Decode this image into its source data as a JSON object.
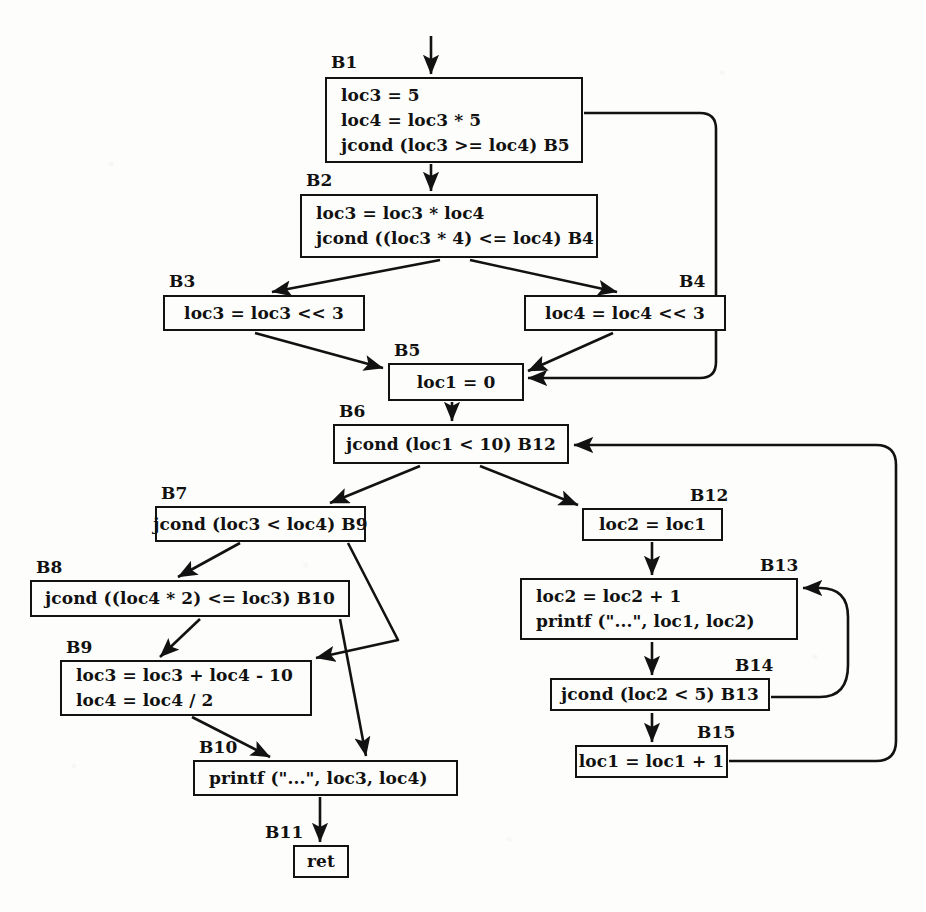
{
  "diagram": {
    "kind": "control-flow-graph",
    "ink_color": "#121212",
    "paper_color": "#fdfdfb"
  },
  "blocks": [
    {
      "id": "B1",
      "label": "B1",
      "label_x": 331,
      "label_y": 52,
      "x": 325,
      "y": 77,
      "w": 258,
      "h": 86,
      "align": "left",
      "statements": [
        "loc3 = 5",
        "loc4 = loc3 * 5",
        "jcond (loc3 >= loc4) B5"
      ]
    },
    {
      "id": "B2",
      "label": "B2",
      "label_x": 306,
      "label_y": 170,
      "x": 300,
      "y": 194,
      "w": 298,
      "h": 64,
      "align": "left",
      "statements": [
        "loc3 = loc3 * loc4",
        "jcond ((loc3 * 4) <= loc4) B4"
      ]
    },
    {
      "id": "B3",
      "label": "B3",
      "label_x": 169,
      "label_y": 271,
      "x": 163,
      "y": 295,
      "w": 202,
      "h": 36,
      "align": "center",
      "statements": [
        "loc3 = loc3 << 3"
      ]
    },
    {
      "id": "B4",
      "label": "B4",
      "label_x": 679,
      "label_y": 271,
      "x": 524,
      "y": 295,
      "w": 202,
      "h": 36,
      "align": "center",
      "statements": [
        "loc4 = loc4 << 3"
      ]
    },
    {
      "id": "B5",
      "label": "B5",
      "label_x": 394,
      "label_y": 340,
      "x": 388,
      "y": 363,
      "w": 136,
      "h": 38,
      "align": "center",
      "statements": [
        "loc1 = 0"
      ]
    },
    {
      "id": "B6",
      "label": "B6",
      "label_x": 339,
      "label_y": 401,
      "x": 333,
      "y": 424,
      "w": 236,
      "h": 40,
      "align": "center",
      "statements": [
        "jcond (loc1 < 10) B12"
      ]
    },
    {
      "id": "B7",
      "label": "B7",
      "label_x": 161,
      "label_y": 483,
      "x": 155,
      "y": 506,
      "w": 211,
      "h": 36,
      "align": "center",
      "statements": [
        "jcond (loc3 < loc4) B9"
      ]
    },
    {
      "id": "B8",
      "label": "B8",
      "label_x": 36,
      "label_y": 557,
      "x": 30,
      "y": 580,
      "w": 320,
      "h": 37,
      "align": "center",
      "statements": [
        "jcond ((loc4 * 2) <= loc3) B10"
      ]
    },
    {
      "id": "B9",
      "label": "B9",
      "label_x": 66,
      "label_y": 637,
      "x": 60,
      "y": 660,
      "w": 252,
      "h": 56,
      "align": "left",
      "statements": [
        "loc3 = loc3 + loc4 - 10",
        "loc4 = loc4 / 2"
      ]
    },
    {
      "id": "B10",
      "label": "B10",
      "label_x": 199,
      "label_y": 737,
      "x": 193,
      "y": 760,
      "w": 265,
      "h": 36,
      "align": "left",
      "statements": [
        "printf (\"...\", loc3, loc4)"
      ]
    },
    {
      "id": "B11",
      "label": "B11",
      "label_x": 265,
      "label_y": 822,
      "x": 293,
      "y": 845,
      "w": 56,
      "h": 33,
      "align": "center",
      "statements": [
        "ret"
      ]
    },
    {
      "id": "B12",
      "label": "B12",
      "label_x": 690,
      "label_y": 485,
      "x": 582,
      "y": 508,
      "w": 141,
      "h": 33,
      "align": "center",
      "statements": [
        "loc2 = loc1"
      ]
    },
    {
      "id": "B13",
      "label": "B13",
      "label_x": 760,
      "label_y": 555,
      "x": 520,
      "y": 578,
      "w": 278,
      "h": 62,
      "align": "left",
      "statements": [
        "loc2 = loc2 + 1",
        "printf (\"...\", loc1, loc2)"
      ]
    },
    {
      "id": "B14",
      "label": "B14",
      "label_x": 735,
      "label_y": 655,
      "x": 550,
      "y": 678,
      "w": 220,
      "h": 33,
      "align": "center",
      "statements": [
        "jcond (loc2 < 5) B13"
      ]
    },
    {
      "id": "B15",
      "label": "B15",
      "label_x": 697,
      "label_y": 722,
      "x": 575,
      "y": 745,
      "w": 153,
      "h": 33,
      "align": "center",
      "statements": [
        "loc1 = loc1 + 1"
      ]
    }
  ],
  "edges": [
    {
      "name": "entry-to-B1",
      "from": "entry",
      "to": "B1",
      "d": "M 431 36 L 431 74"
    },
    {
      "name": "B1-to-B2",
      "from": "B1",
      "to": "B2",
      "d": "M 431 164 L 431 191"
    },
    {
      "name": "B1-to-B5",
      "from": "B1",
      "to": "B5",
      "d": "M 584 113 L 700 113 Q 716 113 716 129 L 716 362 Q 716 378 700 378 L 528 378"
    },
    {
      "name": "B2-to-B3",
      "from": "B2",
      "to": "B3",
      "d": "M 440 260 L 272 292"
    },
    {
      "name": "B2-to-B4",
      "from": "B2",
      "to": "B4",
      "d": "M 470 260 L 617 292"
    },
    {
      "name": "B3-to-B5",
      "from": "B3",
      "to": "B5",
      "d": "M 255 333 L 383 368"
    },
    {
      "name": "B4-to-B5",
      "from": "B4",
      "to": "B5",
      "d": "M 613 333 L 528 371"
    },
    {
      "name": "B5-to-B6",
      "from": "B5",
      "to": "B6",
      "d": "M 452 402 L 452 421"
    },
    {
      "name": "B6-to-B7",
      "from": "B6",
      "to": "B7",
      "d": "M 420 466 L 330 503"
    },
    {
      "name": "B6-to-B12",
      "from": "B6",
      "to": "B12",
      "d": "M 480 466 L 578 505"
    },
    {
      "name": "B7-to-B8",
      "from": "B7",
      "to": "B8",
      "d": "M 240 543 L 178 577"
    },
    {
      "name": "B7-to-B9",
      "from": "B7",
      "to": "B9",
      "d": "M 348 543 L 398 640 L 316 658"
    },
    {
      "name": "B8-to-B9",
      "from": "B8",
      "to": "B9",
      "d": "M 200 619 L 160 657"
    },
    {
      "name": "B8-to-B10",
      "from": "B8",
      "to": "B10",
      "d": "M 340 619 L 366 756"
    },
    {
      "name": "B9-to-B10",
      "from": "B9",
      "to": "B10",
      "d": "M 192 717 L 270 757"
    },
    {
      "name": "B10-to-B11",
      "from": "B10",
      "to": "B11",
      "d": "M 320 797 L 320 842"
    },
    {
      "name": "B12-to-B13",
      "from": "B12",
      "to": "B13",
      "d": "M 652 542 L 652 575"
    },
    {
      "name": "B13-to-B14",
      "from": "B13",
      "to": "B14",
      "d": "M 652 642 L 652 675"
    },
    {
      "name": "B14-to-B15",
      "from": "B14",
      "to": "B15",
      "d": "M 652 713 L 652 742"
    },
    {
      "name": "B14-to-B13",
      "from": "B14",
      "to": "B13",
      "d": "M 771 697 L 820 697 Q 848 697 848 665 L 848 617 Q 848 588 820 588 L 803 588"
    },
    {
      "name": "B15-to-B6",
      "from": "B15",
      "to": "B6",
      "d": "M 729 761 L 876 761 Q 896 761 896 741 L 896 465 Q 896 445 876 445 L 574 445"
    }
  ],
  "entry_marker": {
    "name": "entry-arrow",
    "x": 431,
    "y": 36
  }
}
